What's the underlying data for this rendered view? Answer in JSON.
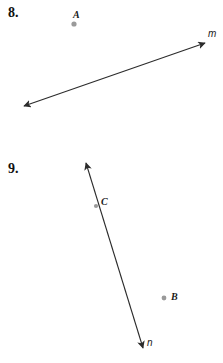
{
  "page": {
    "background_color": "#ffffff",
    "width": 223,
    "height": 363
  },
  "style": {
    "stroke_color": "#2b2b2b",
    "point_color": "#9a9a9a",
    "text_color": "#1a1a1a"
  },
  "problems": [
    {
      "number": "8.",
      "points": [
        {
          "label": "A",
          "x": 74,
          "y": 24
        }
      ],
      "lines": [
        {
          "label": "m",
          "type": "double-arrow",
          "x1": 24,
          "y1": 106,
          "x2": 205,
          "y2": 43
        }
      ]
    },
    {
      "number": "9.",
      "points": [
        {
          "label": "C",
          "x": 96,
          "y": 206
        },
        {
          "label": "B",
          "x": 164,
          "y": 298
        }
      ],
      "lines": [
        {
          "label": "n",
          "type": "double-arrow",
          "x1": 86,
          "y1": 163,
          "x2": 143,
          "y2": 348
        }
      ]
    }
  ]
}
